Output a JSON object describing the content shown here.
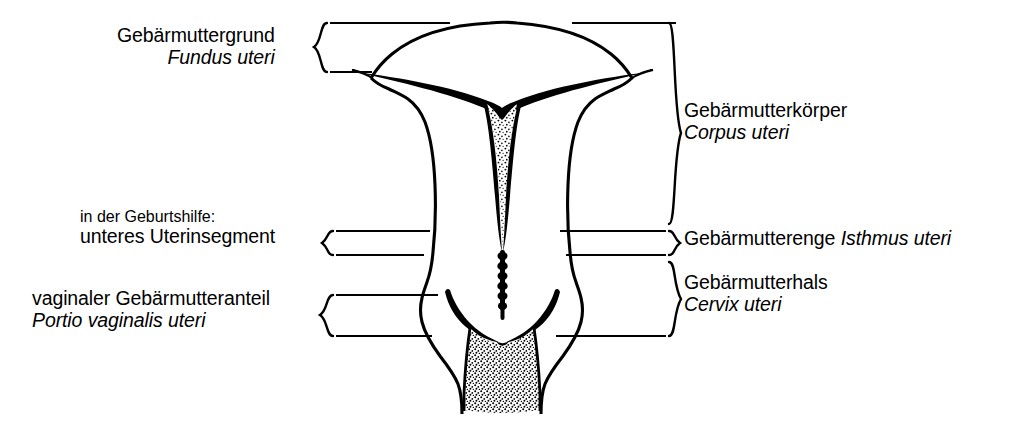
{
  "figure": {
    "ink_color": "#000000",
    "background_color": "#ffffff"
  },
  "labels": {
    "fundus": {
      "german": "Gebärmuttergrund",
      "latin": "Fundus uteri"
    },
    "corpus": {
      "german": "Gebärmutterkörper",
      "latin": "Corpus uteri"
    },
    "obstetric": {
      "note": "in der Geburtshilfe:",
      "german": "unteres Uterinsegment"
    },
    "isthmus": {
      "german": "Gebärmutterenge",
      "latin": "Isthmus uteri"
    },
    "cervix": {
      "german": "Gebärmutterhals",
      "latin": "Cervix uteri"
    },
    "portio": {
      "german": "vaginaler Gebärmutteranteil",
      "latin": "Portio vaginalis uteri"
    }
  }
}
